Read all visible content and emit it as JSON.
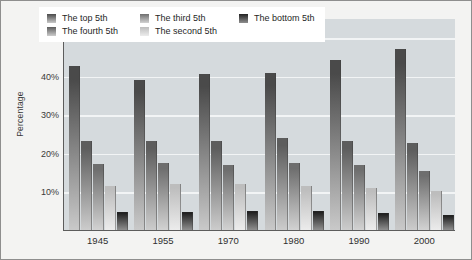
{
  "chart_data": {
    "type": "bar",
    "title": "",
    "xlabel": "",
    "ylabel": "Percentage",
    "categories": [
      "1945",
      "1955",
      "1970",
      "1980",
      "1990",
      "2000"
    ],
    "ylim": [
      0,
      55
    ],
    "ytick_labels": [
      "10%",
      "20%",
      "30%",
      "40%",
      "50%"
    ],
    "ytick_values": [
      10,
      20,
      30,
      40,
      50
    ],
    "grid": "horizontal",
    "legend_position": "top",
    "series": [
      {
        "name": "The top 5th",
        "color": "#4a4a4a",
        "color_light": "#c9c9c9",
        "values": [
          42.5,
          39.0,
          40.5,
          40.8,
          44.0,
          47.0
        ]
      },
      {
        "name": "The fourth 5th",
        "color": "#5d5d5d",
        "color_light": "#cccccc",
        "values": [
          23.0,
          23.0,
          23.0,
          24.0,
          23.0,
          22.5
        ]
      },
      {
        "name": "The third 5th",
        "color": "#6e6e6e",
        "color_light": "#d2d2d2",
        "values": [
          17.0,
          17.5,
          16.8,
          17.5,
          16.8,
          15.2
        ]
      },
      {
        "name": "The second 5th",
        "color": "#bdbdbd",
        "color_light": "#ececec",
        "values": [
          11.5,
          12.0,
          12.0,
          11.5,
          10.8,
          10.0
        ]
      },
      {
        "name": "The bottom 5th",
        "color": "#222222",
        "color_light": "#8f8f8f",
        "values": [
          4.8,
          4.8,
          5.0,
          5.0,
          4.5,
          4.0
        ]
      }
    ]
  },
  "axis": {
    "y_title": "Percentage"
  }
}
